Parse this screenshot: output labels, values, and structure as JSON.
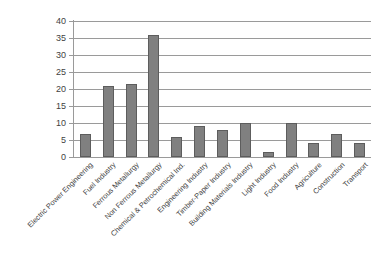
{
  "chart_data": {
    "type": "bar",
    "title": "",
    "subtitle": "",
    "xlabel": "",
    "ylabel": "",
    "ylim": [
      0,
      40
    ],
    "ytick_step": 5,
    "yticks": [
      0,
      5,
      10,
      15,
      20,
      25,
      30,
      35,
      40
    ],
    "grid": true,
    "legend": false,
    "legend_position": "none",
    "bar_color": "#808080",
    "bar_edge_color": "#5d5d5d",
    "gridline_color": "#9a9a9a",
    "xtick_rotation": -45,
    "categories": [
      "Electric Power Engineering",
      "Fuel Industry",
      "Ferrous Metallurgy",
      "Non Ferrous Metallurgy",
      "Chemical & Petrochemical Ind.",
      "Engineering Industry",
      "Timber-Paper Industry",
      "Building Materials Industry",
      "Light Industry",
      "Food Industry",
      "Agriculture",
      "Construction",
      "Transport"
    ],
    "values": [
      6.7,
      21.0,
      21.4,
      35.8,
      6.0,
      9.0,
      8.0,
      9.9,
      1.5,
      9.9,
      4.1,
      6.7,
      4.1
    ]
  }
}
